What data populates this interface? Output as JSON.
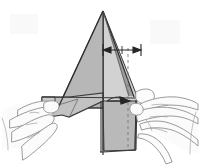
{
  "figure": {
    "kind": "origami-folding-instruction-diagram",
    "title": "Origami paper-fold step: two hands shaping a tall triangular form",
    "background_color": "#ffffff",
    "canvas": {
      "width": 200,
      "height": 166
    },
    "palette": {
      "paper_front": "#b4b4b4",
      "paper_back": "#c9c9c9",
      "paper_flap": "#c2c2c2",
      "paper_right_panel": "#d2d2d2",
      "paper_lower_panel": "#a8a8a8",
      "outline": "#3a3a3a",
      "fold_line": "#6b6b6b",
      "dashed_line": "#7a7a7a",
      "hand_outline": "#8b8b8b",
      "hand_fill": "#fbfbfb",
      "arrow_color": "#262626"
    },
    "parts": [
      {
        "name": "main-triangle",
        "label": "Large triangular paper body",
        "fill": "#b4b4b4"
      },
      {
        "name": "right-panel",
        "label": "Right folded panel",
        "fill": "#d2d2d2"
      },
      {
        "name": "left-wing-flap",
        "label": "Left wing flap",
        "fill": "#c2c2c2"
      },
      {
        "name": "lower-body-panel",
        "label": "Lower body panel",
        "fill": "#a8a8a8"
      },
      {
        "name": "left-hand",
        "label": "Left hand holding paper",
        "fill": "#fbfbfb"
      },
      {
        "name": "right-hand",
        "label": "Right hand holding paper",
        "fill": "#fbfbfb"
      }
    ],
    "annotations": [
      {
        "name": "dimension-arrow",
        "type": "double-headed-dimension-arrow",
        "orientation": "horizontal",
        "from_x": 103,
        "to_x": 141,
        "y": 50,
        "color": "#262626"
      },
      {
        "name": "fold-direction-arrow",
        "type": "single-headed-arrow",
        "orientation": "horizontal-right",
        "from_x": 109,
        "to_x": 130,
        "y": 101,
        "color": "#262626"
      },
      {
        "name": "center-fold-line",
        "type": "solid-vertical-line",
        "x": 103,
        "from_y": 11,
        "to_y": 155,
        "color": "#3a3a3a"
      },
      {
        "name": "reference-dashed-line",
        "type": "dashed-vertical-line",
        "x": 128,
        "from_y": 48,
        "to_y": 150,
        "color": "#7a7a7a"
      }
    ]
  }
}
